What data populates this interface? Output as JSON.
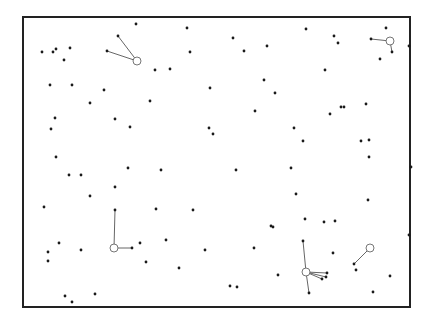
{
  "figure": {
    "type": "spatial point pattern with hub assignments",
    "colors": {
      "border": "#222222",
      "point": "#1a1a1a",
      "link": "#555555",
      "hub": "#666666",
      "background": "#ffffff"
    },
    "frame": {
      "x1": 23,
      "y1": 17,
      "x2": 410,
      "y2": 307
    },
    "points": [
      [
        136,
        24
      ],
      [
        187,
        28
      ],
      [
        306,
        29
      ],
      [
        386,
        28
      ],
      [
        42,
        52
      ],
      [
        53,
        52
      ],
      [
        56,
        49
      ],
      [
        70,
        48
      ],
      [
        64,
        60
      ],
      [
        190,
        52
      ],
      [
        233,
        38
      ],
      [
        244,
        51
      ],
      [
        267,
        46
      ],
      [
        334,
        36
      ],
      [
        338,
        43
      ],
      [
        409,
        46
      ],
      [
        380,
        59
      ],
      [
        325,
        70
      ],
      [
        50,
        85
      ],
      [
        72,
        85
      ],
      [
        104,
        90
      ],
      [
        90,
        103
      ],
      [
        155,
        70
      ],
      [
        170,
        69
      ],
      [
        210,
        88
      ],
      [
        264,
        80
      ],
      [
        275,
        93
      ],
      [
        55,
        118
      ],
      [
        51,
        129
      ],
      [
        115,
        119
      ],
      [
        130,
        127
      ],
      [
        150,
        101
      ],
      [
        209,
        128
      ],
      [
        213,
        134
      ],
      [
        255,
        111
      ],
      [
        344,
        107
      ],
      [
        341,
        107
      ],
      [
        330,
        114
      ],
      [
        366,
        104
      ],
      [
        294,
        128
      ],
      [
        303,
        141
      ],
      [
        361,
        141
      ],
      [
        369,
        157
      ],
      [
        369,
        140
      ],
      [
        411,
        167
      ],
      [
        291,
        168
      ],
      [
        56,
        157
      ],
      [
        69,
        175
      ],
      [
        81,
        175
      ],
      [
        115,
        187
      ],
      [
        128,
        168
      ],
      [
        161,
        170
      ],
      [
        236,
        170
      ],
      [
        296,
        194
      ],
      [
        44,
        207
      ],
      [
        90,
        196
      ],
      [
        156,
        209
      ],
      [
        140,
        243
      ],
      [
        59,
        243
      ],
      [
        48,
        252
      ],
      [
        48,
        261
      ],
      [
        81,
        250
      ],
      [
        166,
        240
      ],
      [
        205,
        250
      ],
      [
        193,
        210
      ],
      [
        271,
        226
      ],
      [
        273,
        227
      ],
      [
        305,
        219
      ],
      [
        324,
        222
      ],
      [
        335,
        221
      ],
      [
        409,
        235
      ],
      [
        368,
        200
      ],
      [
        146,
        262
      ],
      [
        179,
        268
      ],
      [
        254,
        248
      ],
      [
        230,
        286
      ],
      [
        237,
        287
      ],
      [
        65,
        296
      ],
      [
        72,
        302
      ],
      [
        95,
        294
      ],
      [
        356,
        270
      ],
      [
        390,
        276
      ],
      [
        373,
        292
      ],
      [
        278,
        275
      ],
      [
        333,
        253
      ]
    ],
    "hubs": [
      {
        "center": [
          137,
          61
        ],
        "r": 4,
        "members": [
          [
            118,
            36
          ],
          [
            107,
            51
          ]
        ]
      },
      {
        "center": [
          390,
          41
        ],
        "r": 4,
        "members": [
          [
            371,
            39
          ],
          [
            392,
            52
          ]
        ]
      },
      {
        "center": [
          114,
          248
        ],
        "r": 4,
        "members": [
          [
            115,
            210
          ],
          [
            132,
            248
          ]
        ]
      },
      {
        "center": [
          306,
          272
        ],
        "r": 4,
        "members": [
          [
            303,
            241
          ],
          [
            327,
            273
          ],
          [
            326,
            277
          ],
          [
            322,
            279
          ],
          [
            309,
            293
          ]
        ]
      },
      {
        "center": [
          370,
          248
        ],
        "r": 4,
        "members": [
          [
            354,
            264
          ]
        ]
      }
    ]
  }
}
